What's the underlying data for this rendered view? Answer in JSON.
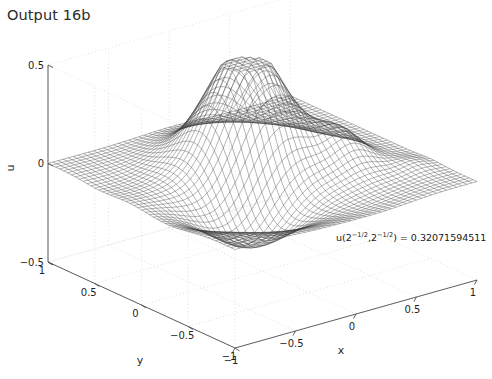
{
  "figure": {
    "title": "Output 16b",
    "background_color": "#ffffff",
    "axis_color": "#4d4d4d",
    "grid_color": "#d8d8d8",
    "mesh_color": "#3a3a3a"
  },
  "annotation": {
    "prefix": "u(2",
    "sup1": "−1/2",
    "mid": ",2",
    "sup2": "−1/2",
    "suffix": ") =",
    "value": "0.32071594511",
    "full_text": "u(2^-1/2,2^-1/2) = 0.32071594511"
  },
  "axes": {
    "x": {
      "label": "x",
      "ticks": [
        "−1",
        "−0.5",
        "0",
        "0.5",
        "1"
      ],
      "range": [
        -1,
        1
      ]
    },
    "y": {
      "label": "y",
      "ticks": [
        "1",
        "0.5",
        "0",
        "−0.5",
        "−1"
      ],
      "range": [
        -1,
        1
      ]
    },
    "z": {
      "label": "u",
      "ticks": [
        "0.5",
        "0",
        "−0.5"
      ],
      "range": [
        -0.5,
        0.5
      ]
    }
  },
  "chart_data": {
    "type": "surface",
    "title": "Output 16b",
    "xlabel": "x",
    "ylabel": "y",
    "zlabel": "u",
    "xlim": [
      -1,
      1
    ],
    "ylim": [
      -1,
      1
    ],
    "zlim": [
      -0.5,
      0.5
    ],
    "grid": true,
    "legend": null,
    "mesh_nx": 49,
    "mesh_ny": 49,
    "view_azimuth": -37.5,
    "view_elevation": 30,
    "annotations": [
      {
        "text": "u(2^-1/2,2^-1/2) = 0.32071594511",
        "x": 0.7071067811865476,
        "y": 0.7071067811865476,
        "value": 0.32071594511
      }
    ],
    "surface_description": "Dense wireframe mesh of a smooth function u(x,y) on [-1,1]x[-1,1]; one tall central-rear peak reaching about u = 0.5, a broad shallow trough near the front-left reaching about u = -0.3, and two smaller secondary bumps on the right side.",
    "peaks": [
      {
        "x": 0.05,
        "y": 0.2,
        "u": 0.5
      },
      {
        "x": 0.55,
        "y": -0.2,
        "u": 0.16
      },
      {
        "x": 0.85,
        "y": -0.55,
        "u": 0.07
      }
    ],
    "troughs": [
      {
        "x": -0.45,
        "y": -0.35,
        "u": -0.3
      }
    ],
    "z_ticks": [
      -0.5,
      0,
      0.5
    ],
    "x_ticks": [
      -1,
      -0.5,
      0,
      0.5,
      1
    ],
    "y_ticks": [
      -1,
      -0.5,
      0,
      0.5,
      1
    ]
  }
}
